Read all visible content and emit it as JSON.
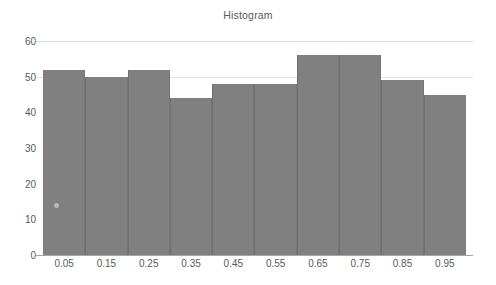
{
  "chart_data": {
    "type": "bar",
    "title": "Histogram",
    "xlabel": "",
    "ylabel": "",
    "categories": [
      "0.05",
      "0.15",
      "0.25",
      "0.35",
      "0.45",
      "0.55",
      "0.65",
      "0.75",
      "0.85",
      "0.95"
    ],
    "values": [
      52,
      50,
      52,
      44,
      48,
      48,
      56,
      56,
      49,
      45
    ],
    "ylim": [
      0,
      60
    ],
    "yticks": [
      0,
      10,
      20,
      30,
      40,
      50,
      60
    ],
    "ytick_labels": [
      "0",
      "10",
      "20",
      "30",
      "40",
      "50",
      "60"
    ],
    "gridlines": [
      "50",
      "60"
    ],
    "grid": true,
    "legend": null,
    "bar_color": "#808080",
    "text_color": "#595959",
    "grid_color": "#d9d9d9",
    "background": "#ffffff"
  }
}
